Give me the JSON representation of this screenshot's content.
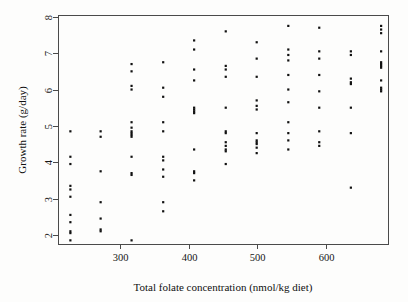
{
  "figure": {
    "background_color": "#fdfdfc",
    "frame_color": "#4a4a4a",
    "point_color": "#111111"
  },
  "chart_data": {
    "type": "scatter",
    "title": "",
    "xlabel": "Total folate concentration (nmol/kg diet)",
    "ylabel": "Growth rate (g/day)",
    "xlim": [
      210,
      690
    ],
    "ylim": [
      1.75,
      8.05
    ],
    "xticks": [
      300,
      400,
      500,
      600
    ],
    "xtick_labels": [
      "300",
      "400",
      "500",
      "600"
    ],
    "yticks": [
      2,
      3,
      4,
      5,
      6,
      7,
      8
    ],
    "ytick_labels": [
      "2",
      "3",
      "4",
      "5",
      "6",
      "7",
      "8"
    ],
    "grid": false,
    "legend": null,
    "marker": "filled-square",
    "marker_size": 2.2,
    "x": [
      228,
      228,
      228,
      228,
      228,
      228,
      228,
      228,
      228,
      228,
      228,
      272,
      272,
      272,
      272,
      272,
      272,
      272,
      317,
      317,
      317,
      317,
      317,
      317,
      317,
      317,
      317,
      317,
      317,
      317,
      317,
      317,
      363,
      363,
      363,
      363,
      363,
      363,
      363,
      363,
      363,
      363,
      363,
      408,
      408,
      408,
      408,
      408,
      408,
      408,
      408,
      408,
      408,
      408,
      408,
      454,
      454,
      454,
      454,
      454,
      454,
      454,
      454,
      454,
      454,
      454,
      454,
      499,
      499,
      499,
      499,
      499,
      499,
      499,
      499,
      499,
      499,
      499,
      499,
      545,
      545,
      545,
      545,
      545,
      545,
      545,
      545,
      545,
      545,
      545,
      590,
      590,
      590,
      590,
      590,
      590,
      590,
      590,
      590,
      636,
      636,
      636,
      636,
      636,
      636,
      636,
      636,
      680,
      680,
      680,
      680,
      680,
      680,
      680,
      680,
      680,
      680,
      680,
      680
    ],
    "y": [
      4.85,
      4.15,
      3.95,
      3.35,
      3.25,
      3.05,
      2.55,
      2.35,
      2.1,
      2.05,
      1.85,
      4.85,
      4.7,
      3.75,
      2.9,
      2.45,
      2.15,
      2.1,
      6.7,
      6.5,
      6.1,
      6.0,
      5.1,
      4.95,
      4.85,
      4.8,
      4.75,
      4.7,
      4.15,
      3.7,
      3.65,
      1.85,
      6.75,
      6.05,
      5.8,
      5.1,
      4.85,
      4.15,
      4.05,
      3.8,
      3.6,
      2.9,
      2.65,
      7.35,
      7.1,
      6.55,
      6.25,
      5.5,
      5.45,
      5.4,
      5.35,
      4.35,
      3.75,
      3.7,
      3.5,
      7.6,
      6.65,
      6.55,
      6.35,
      5.5,
      4.85,
      4.8,
      4.55,
      4.45,
      4.35,
      4.3,
      3.95,
      7.3,
      6.85,
      6.35,
      5.7,
      5.55,
      5.45,
      4.8,
      4.6,
      4.55,
      4.5,
      4.4,
      4.25,
      7.75,
      7.1,
      6.95,
      6.8,
      6.4,
      6.0,
      5.65,
      5.1,
      4.8,
      4.6,
      4.35,
      7.7,
      7.05,
      6.85,
      6.4,
      5.95,
      5.5,
      4.85,
      4.55,
      4.45,
      7.05,
      6.95,
      6.3,
      6.2,
      6.15,
      5.5,
      4.8,
      3.3,
      7.75,
      7.65,
      7.55,
      7.05,
      6.75,
      6.7,
      6.65,
      6.6,
      6.25,
      6.05,
      6.0,
      5.95
    ]
  }
}
